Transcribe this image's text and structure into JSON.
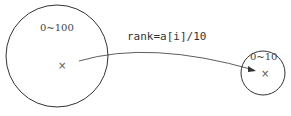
{
  "diagram": {
    "big_circle": {
      "label": "0~100",
      "marker": "×"
    },
    "small_circle": {
      "label": "0~10",
      "marker": "×"
    },
    "arrow": {
      "label": "rank=a[i]/10"
    }
  }
}
